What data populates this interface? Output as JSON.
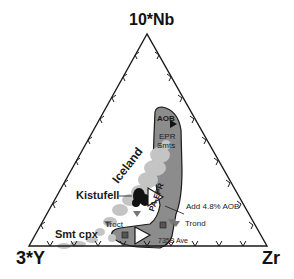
{
  "diagram": {
    "type": "ternary",
    "apices": {
      "top": "10*Nb",
      "left": "3*Y",
      "right": "Zr"
    },
    "fields": {
      "aob": "AOB",
      "epr_line1": "EPR",
      "epr_line2": "Smts",
      "pa_epr": "PA-EPR"
    },
    "labels": {
      "iceland": "Iceland",
      "kistufell": "Kistufell",
      "add_aob": "Add 4.8% AOB",
      "troct": "Troct",
      "trond": "Trond",
      "smt_cpx": "Smt cpx",
      "ave_735b": "735B Ave"
    },
    "colors": {
      "axis": "#1a1a1a",
      "field_fill": "#8c8c8c",
      "data_light": "#c4c4c4",
      "kistufell": "#111111",
      "marker": "#777777"
    }
  }
}
